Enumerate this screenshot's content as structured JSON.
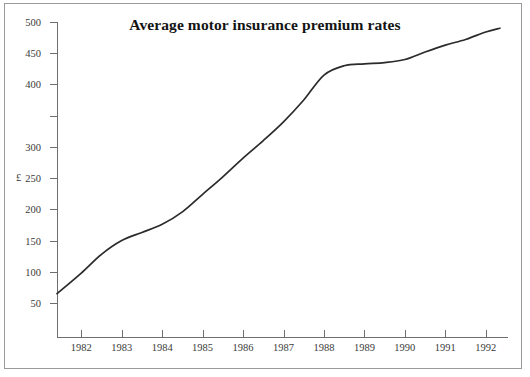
{
  "figure": {
    "y_axis_title": "£",
    "background_color": "#ffffff",
    "line_color": "#2b2b2b",
    "axis_color": "#6e6e6e",
    "text_color": "#3a3a3a",
    "frame_color": "#9a9a9a"
  },
  "chart_data": {
    "type": "line",
    "title": "Average motor insurance premium rates",
    "xlabel": "",
    "ylabel": "£",
    "grid": false,
    "legend": "none",
    "xlim": [
      1981.4,
      1992.55
    ],
    "ylim": [
      0,
      500
    ],
    "xtick_labels": [
      "1982",
      "1983",
      "1984",
      "1985",
      "1986",
      "1987",
      "1988",
      "1989",
      "1990",
      "1991",
      "1992"
    ],
    "xtick_values": [
      1982,
      1983,
      1984,
      1985,
      1986,
      1987,
      1988,
      1989,
      1990,
      1991,
      1992
    ],
    "ytick_labels": [
      "500",
      "450",
      "400",
      "300",
      "250",
      "200",
      "150",
      "100",
      "50"
    ],
    "ytick_values": [
      500,
      450,
      400,
      350,
      300,
      250,
      200,
      150,
      100,
      50
    ],
    "ytick_note": "Printed tick labels omit 350; ticks are evenly spaced at 50 unit intervals.",
    "series": [
      {
        "name": "Average motor insurance premium rate",
        "x": [
          1981.4,
          1982.0,
          1982.5,
          1983.0,
          1983.5,
          1984.0,
          1984.5,
          1985.0,
          1985.5,
          1986.0,
          1986.5,
          1987.0,
          1987.5,
          1988.0,
          1988.5,
          1989.0,
          1989.5,
          1990.0,
          1990.5,
          1991.0,
          1991.5,
          1992.0,
          1992.35
        ],
        "values": [
          65,
          98,
          128,
          150,
          163,
          176,
          196,
          224,
          252,
          282,
          310,
          340,
          375,
          415,
          430,
          433,
          435,
          440,
          452,
          463,
          472,
          484,
          490
        ]
      }
    ]
  }
}
